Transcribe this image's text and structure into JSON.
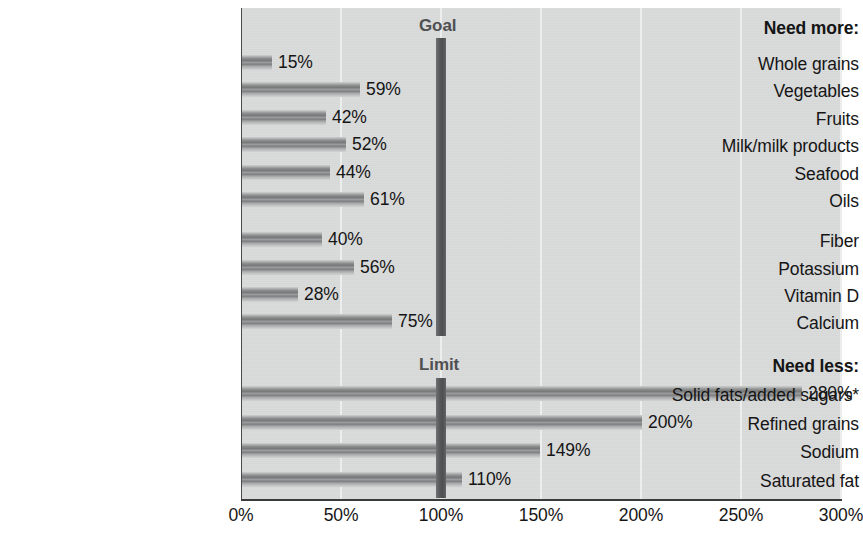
{
  "chart_data": {
    "type": "bar",
    "orientation": "horizontal",
    "title": "",
    "xlabel": "",
    "ylabel": "",
    "xlim": [
      0,
      300
    ],
    "xticks": [
      0,
      50,
      100,
      150,
      200,
      250,
      300
    ],
    "xtick_labels": [
      "0%",
      "50%",
      "100%",
      "150%",
      "200%",
      "250%",
      "300%"
    ],
    "grid": true,
    "legend": "none",
    "value_suffix": "%",
    "groups": [
      {
        "heading": "Need more:",
        "marker_label": "Goal",
        "marker_value": 100,
        "categories": [
          "Whole grains",
          "Vegetables",
          "Fruits",
          "Milk/milk products",
          "Seafood",
          "Oils",
          "Fiber",
          "Potassium",
          "Vitamin D",
          "Calcium"
        ],
        "values": [
          15,
          59,
          42,
          52,
          44,
          61,
          40,
          56,
          28,
          75
        ],
        "value_labels": [
          "15%",
          "59%",
          "42%",
          "52%",
          "44%",
          "61%",
          "40%",
          "56%",
          "28%",
          "75%"
        ]
      },
      {
        "heading": "Need less:",
        "marker_label": "Limit",
        "marker_value": 100,
        "categories": [
          "Solid fats/added sugars*",
          "Refined grains",
          "Sodium",
          "Saturated fat"
        ],
        "values": [
          280,
          200,
          149,
          110
        ],
        "value_labels": [
          "280%",
          "200%",
          "149%",
          "110%"
        ]
      }
    ],
    "colors": {
      "plot_background": "#d9dada",
      "bar_fill": "#8e8f8f",
      "marker_fill": "#535557",
      "gridline": "#eceded",
      "axis": "#3a3a3a",
      "text": "#151515",
      "marker_text": "#4f5052"
    }
  },
  "rows": [
    {
      "kind": "heading",
      "label": "Need more:",
      "top": 19,
      "value": null,
      "value_label": ""
    },
    {
      "kind": "bar",
      "label": "Whole grains",
      "top": 55,
      "value": 15,
      "value_label": "15%"
    },
    {
      "kind": "bar",
      "label": "Vegetables",
      "top": 82,
      "value": 59,
      "value_label": "59%"
    },
    {
      "kind": "bar",
      "label": "Fruits",
      "top": 110,
      "value": 42,
      "value_label": "42%"
    },
    {
      "kind": "bar",
      "label": "Milk/milk products",
      "top": 137,
      "value": 52,
      "value_label": "52%"
    },
    {
      "kind": "bar",
      "label": "Seafood",
      "top": 165,
      "value": 44,
      "value_label": "44%"
    },
    {
      "kind": "bar",
      "label": "Oils",
      "top": 192,
      "value": 61,
      "value_label": "61%"
    },
    {
      "kind": "bar",
      "label": "Fiber",
      "top": 232,
      "value": 40,
      "value_label": "40%"
    },
    {
      "kind": "bar",
      "label": "Potassium",
      "top": 260,
      "value": 56,
      "value_label": "56%"
    },
    {
      "kind": "bar",
      "label": "Vitamin D",
      "top": 287,
      "value": 28,
      "value_label": "28%"
    },
    {
      "kind": "bar",
      "label": "Calcium",
      "top": 314,
      "value": 75,
      "value_label": "75%"
    },
    {
      "kind": "heading",
      "label": "Need less:",
      "top": 357,
      "value": null,
      "value_label": ""
    },
    {
      "kind": "bar",
      "label": "Solid fats/added sugars*",
      "top": 386,
      "value": 280,
      "value_label": "280%"
    },
    {
      "kind": "bar",
      "label": "Refined grains",
      "top": 415,
      "value": 200,
      "value_label": "200%"
    },
    {
      "kind": "bar",
      "label": "Sodium",
      "top": 443,
      "value": 149,
      "value_label": "149%"
    },
    {
      "kind": "bar",
      "label": "Saturated fat",
      "top": 472,
      "value": 110,
      "value_label": "110%"
    }
  ],
  "markers": [
    {
      "name": "goal",
      "label": "Goal",
      "value": 100,
      "label_top": 16,
      "bar_top": 38,
      "bar_height": 298
    },
    {
      "name": "limit",
      "label": "Limit",
      "value": 100,
      "label_top": 355,
      "bar_top": 378,
      "bar_height": 120
    }
  ],
  "axis": {
    "ticks": [
      {
        "value": 0,
        "label": "0%"
      },
      {
        "value": 50,
        "label": "50%"
      },
      {
        "value": 100,
        "label": "100%"
      },
      {
        "value": 150,
        "label": "150%"
      },
      {
        "value": 200,
        "label": "200%"
      },
      {
        "value": 250,
        "label": "250%"
      },
      {
        "value": 300,
        "label": "300%"
      }
    ]
  },
  "geometry": {
    "plot_left": 241,
    "plot_top": 8,
    "plot_width": 600,
    "plot_height": 492,
    "px_per_percent": 2
  }
}
